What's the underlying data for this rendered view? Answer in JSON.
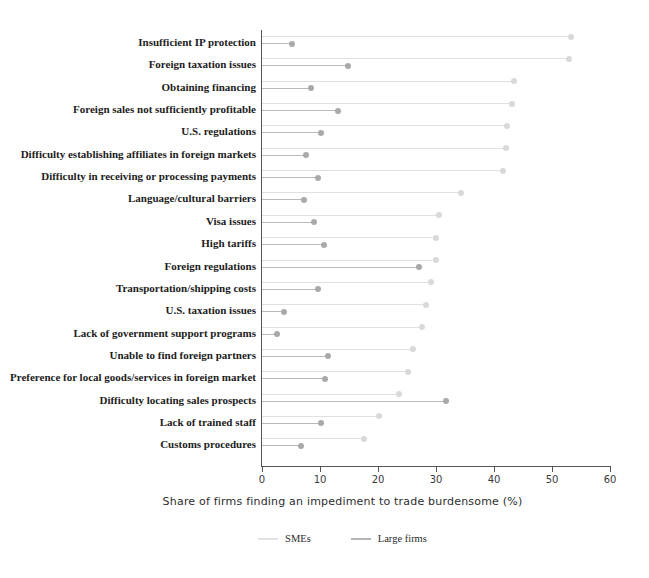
{
  "chart_data": {
    "type": "bar",
    "title": "",
    "xlabel": "Share of firms finding an impediment to trade burdensome (%)",
    "ylabel": "",
    "xlim": [
      0,
      60
    ],
    "xticks": [
      0,
      10,
      20,
      30,
      40,
      50,
      60
    ],
    "grid": false,
    "legend_position": "bottom",
    "categories": [
      "Insufficient IP protection",
      "Foreign taxation issues",
      "Obtaining financing",
      "Foreign sales not sufficiently profitable",
      "U.S. regulations",
      "Difficulty establishing affiliates in foreign markets",
      "Difficulty in receiving or processing payments",
      "Language/cultural barriers",
      "Visa issues",
      "High tariffs",
      "Foreign regulations",
      "Transportation/shipping costs",
      "U.S. taxation issues",
      "Lack of government support programs",
      "Unable to find foreign partners",
      "Preference for local goods/services in foreign market",
      "Difficulty locating sales prospects",
      "Lack of trained staff",
      "Customs procedures"
    ],
    "series": [
      {
        "name": "SMEs",
        "color": "#d9d9d9",
        "values": [
          53.3,
          52.9,
          43.5,
          43.1,
          42.3,
          42.0,
          41.6,
          34.3,
          30.6,
          30.0,
          30.0,
          29.1,
          28.3,
          27.5,
          26.0,
          25.2,
          23.6,
          20.2,
          17.6
        ]
      },
      {
        "name": "Large firms",
        "color": "#a9a9a9",
        "values": [
          5.1,
          14.9,
          8.5,
          13.1,
          10.1,
          7.6,
          9.6,
          7.2,
          8.9,
          10.7,
          27.1,
          9.6,
          3.8,
          2.6,
          11.3,
          10.9,
          31.8,
          10.1,
          6.7
        ]
      }
    ]
  }
}
